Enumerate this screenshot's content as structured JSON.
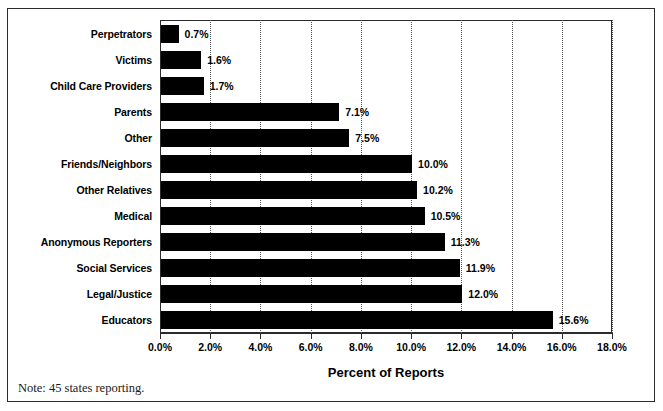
{
  "chart_data": {
    "type": "bar",
    "orientation": "horizontal",
    "title": "",
    "xlabel": "Percent of Reports",
    "ylabel": "",
    "xlim": [
      0.0,
      18.0
    ],
    "xtick_labels": [
      "0.0%",
      "2.0%",
      "4.0%",
      "6.0%",
      "8.0%",
      "10.0%",
      "12.0%",
      "14.0%",
      "16.0%",
      "18.0%"
    ],
    "xticks": [
      0.0,
      2.0,
      4.0,
      6.0,
      8.0,
      10.0,
      12.0,
      14.0,
      16.0,
      18.0
    ],
    "grid": "vertical-dotted",
    "legend": "none",
    "bar_color": "#000000",
    "categories": [
      "Perpetrators",
      "Victims",
      "Child Care Providers",
      "Parents",
      "Other",
      "Friends/Neighbors",
      "Other Relatives",
      "Medical",
      "Anonymous Reporters",
      "Social Services",
      "Legal/Justice",
      "Educators"
    ],
    "values": [
      0.7,
      1.6,
      1.7,
      7.1,
      7.5,
      10.0,
      10.2,
      10.5,
      11.3,
      11.9,
      12.0,
      15.6
    ],
    "value_labels": [
      "0.7%",
      "1.6%",
      "1.7%",
      "7.1%",
      "7.5%",
      "10.0%",
      "10.2%",
      "10.5%",
      "11.3%",
      "11.9%",
      "12.0%",
      "15.6%"
    ],
    "note": "Note: 45 states reporting."
  }
}
